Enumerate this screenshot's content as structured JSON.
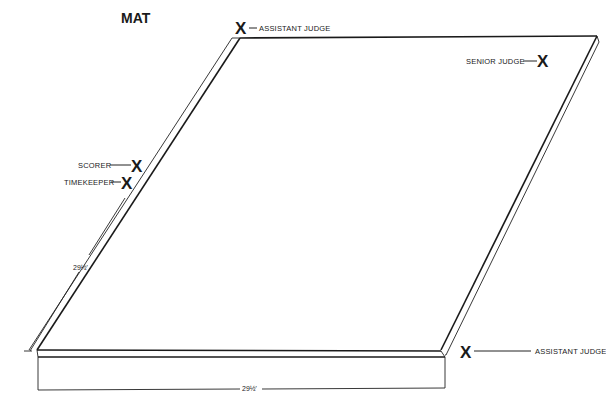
{
  "diagram": {
    "title": "MAT",
    "officials": [
      {
        "id": "assistant-judge-top",
        "mark": "X",
        "label": "ASSISTANT JUDGE"
      },
      {
        "id": "senior-judge",
        "mark": "X",
        "label": "SENIOR JUDGE"
      },
      {
        "id": "scorer",
        "mark": "X",
        "label": "SCORER"
      },
      {
        "id": "timekeeper",
        "mark": "X",
        "label": "TIMEKEEPER"
      },
      {
        "id": "assistant-judge-bottom",
        "mark": "X",
        "label": "ASSISTANT JUDGE"
      }
    ],
    "dimensions": {
      "side": "29½'",
      "front": "29½'"
    },
    "colors": {
      "ink": "#1a1a1a",
      "background": "#ffffff"
    }
  }
}
